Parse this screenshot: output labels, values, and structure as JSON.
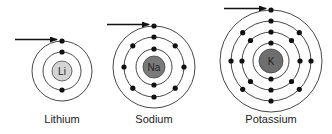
{
  "diagram": {
    "atoms": [
      {
        "name": "Lithium",
        "symbol": "Li",
        "cx": 62,
        "cy": 71,
        "nucleus_r": 10,
        "nucleus_color": "#d4d4d4",
        "shells": [
          {
            "r": 19,
            "electrons": 2
          },
          {
            "r": 30,
            "electrons": 1
          }
        ],
        "label_x": 62,
        "label_y": 122
      },
      {
        "name": "Sodium",
        "symbol": "Na",
        "cx": 154,
        "cy": 67,
        "nucleus_r": 11,
        "nucleus_color": "#7a7a7a",
        "shells": [
          {
            "r": 18,
            "electrons": 2
          },
          {
            "r": 30,
            "electrons": 8
          },
          {
            "r": 41,
            "electrons": 1
          }
        ],
        "label_x": 154,
        "label_y": 122
      },
      {
        "name": "Potassium",
        "symbol": "K",
        "cx": 271,
        "cy": 61,
        "nucleus_r": 12,
        "nucleus_color": "#6e6e6e",
        "shells": [
          {
            "r": 18,
            "electrons": 2
          },
          {
            "r": 29,
            "electrons": 8
          },
          {
            "r": 40,
            "electrons": 8
          },
          {
            "r": 51,
            "electrons": 1
          }
        ],
        "label_x": 271,
        "label_y": 122
      }
    ],
    "arrow_note": "Arrow points to the single valence electron in the outermost shell"
  }
}
